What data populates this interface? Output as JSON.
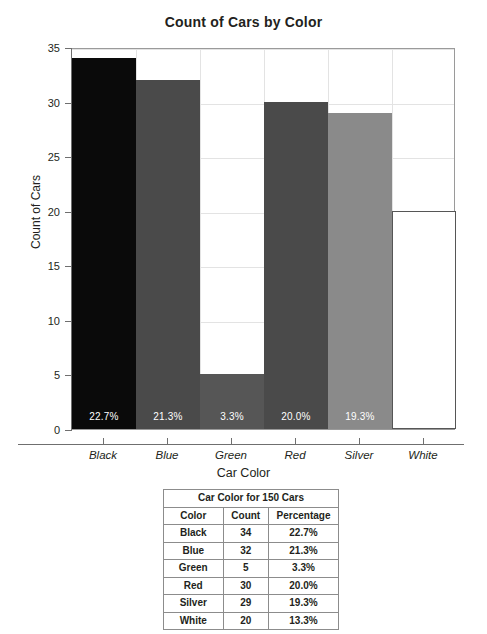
{
  "chart_data": {
    "type": "bar",
    "title": "Count of Cars by Color",
    "xlabel": "Car Color",
    "ylabel": "Count of Cars",
    "categories": [
      "Black",
      "Blue",
      "Green",
      "Red",
      "Silver",
      "White"
    ],
    "values": [
      34,
      32,
      5,
      30,
      29,
      20
    ],
    "bar_labels": [
      "22.7%",
      "21.3%",
      "3.3%",
      "20.0%",
      "19.3%",
      "13.3%"
    ],
    "bar_colors": [
      "#0a0a0a",
      "#4a4a4a",
      "#565656",
      "#4a4a4a",
      "#8a8a8a",
      "#ffffff"
    ],
    "bar_border_colors": [
      "#0a0a0a",
      "#4a4a4a",
      "#565656",
      "#4a4a4a",
      "#8a8a8a",
      "#565656"
    ],
    "ylim": [
      0,
      35
    ],
    "yticks": [
      0,
      5,
      10,
      15,
      20,
      25,
      30,
      35
    ],
    "ytick_labels": [
      "0",
      "5",
      "10",
      "15",
      "20",
      "25",
      "30",
      "35"
    ],
    "grid": true,
    "legend": "none"
  },
  "table": {
    "title": "Car Color for 150 Cars",
    "headers": [
      "Color",
      "Count",
      "Percentage"
    ],
    "rows": [
      [
        "Black",
        "34",
        "22.7%"
      ],
      [
        "Blue",
        "32",
        "21.3%"
      ],
      [
        "Green",
        "5",
        "3.3%"
      ],
      [
        "Red",
        "30",
        "20.0%"
      ],
      [
        "Silver",
        "29",
        "19.3%"
      ],
      [
        "White",
        "20",
        "13.3%"
      ]
    ]
  }
}
